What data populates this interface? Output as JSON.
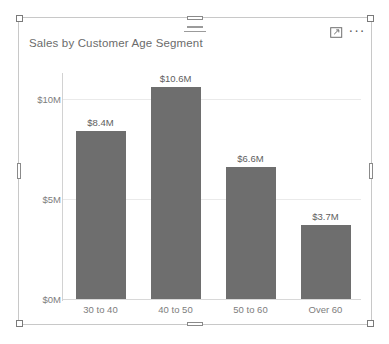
{
  "visual": {
    "title": "Sales by Customer Age Segment",
    "icons": {
      "drag_handle": "drag-handle-icon",
      "focus_mode": "focus-mode-icon",
      "more_options": "···"
    },
    "colors": {
      "bar": "#6e6e6e",
      "gridline": "#eaeaea",
      "axis_text": "#7d7d7d",
      "title_text": "#6b6b6b",
      "card_border": "#c8c8c8",
      "background": "#ffffff"
    }
  },
  "chart_data": {
    "type": "bar",
    "title": "Sales by Customer Age Segment",
    "xlabel": "",
    "ylabel": "",
    "categories": [
      "30 to 40",
      "40 to 50",
      "50 to 60",
      "Over 60"
    ],
    "values": [
      8.4,
      10.6,
      6.6,
      3.7
    ],
    "value_labels": [
      "$8.4M",
      "$10.6M",
      "$6.6M",
      "$3.7M"
    ],
    "ylim": [
      0,
      12
    ],
    "yticks": [
      0,
      5,
      10
    ],
    "ytick_labels": [
      "$0M",
      "$5M",
      "$10M"
    ],
    "grid": true,
    "legend": false,
    "units": "USD millions"
  }
}
